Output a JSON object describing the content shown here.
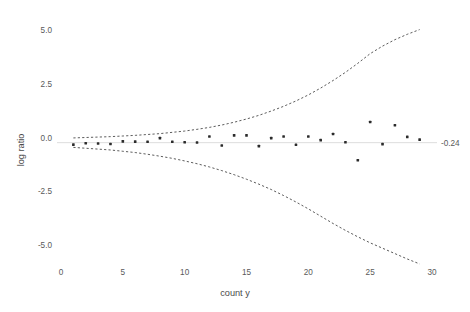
{
  "chart_data": {
    "type": "scatter",
    "title": "",
    "xlabel": "count y",
    "ylabel": "log ratio",
    "xlim": [
      -1.5,
      32.5
    ],
    "ylim": [
      -6.2,
      6.0
    ],
    "grid": false,
    "legend": null,
    "xticks": [
      0,
      5,
      10,
      15,
      20,
      25,
      30
    ],
    "xtick_labels": [
      "0",
      "5",
      "10",
      "15",
      "20",
      "25",
      "30"
    ],
    "yticks": [
      5.0,
      2.5,
      0.0,
      -2.5,
      -5.0
    ],
    "ytick_labels": [
      "5.0",
      "2.5",
      "0.0",
      "-2.5",
      "-5.0"
    ],
    "x": [
      1,
      2,
      3,
      4,
      5,
      6,
      7,
      8,
      9,
      10,
      11,
      12,
      13,
      14,
      15,
      16,
      17,
      18,
      19,
      20,
      21,
      22,
      23,
      24,
      25,
      26,
      27,
      28,
      29
    ],
    "values": [
      -0.33,
      -0.27,
      -0.28,
      -0.3,
      -0.18,
      -0.19,
      -0.2,
      -0.03,
      -0.2,
      -0.22,
      -0.23,
      0.05,
      -0.37,
      0.1,
      0.1,
      -0.4,
      -0.03,
      0.05,
      -0.34,
      0.05,
      -0.12,
      0.16,
      -0.22,
      -1.06,
      0.72,
      -0.31,
      0.57,
      0.03,
      -0.1
    ],
    "reference_line": {
      "y": -0.24,
      "label": "-0.24",
      "style": "solid",
      "color": "#d9d9d9"
    },
    "control_limits": {
      "label": "funnel control limits",
      "style": "dashed",
      "color": "#4a4a4a",
      "upper": {
        "x": [
          1,
          2,
          3,
          4,
          5,
          6,
          7,
          8,
          9,
          10,
          11,
          12,
          13,
          14,
          15,
          16,
          17,
          18,
          19,
          20,
          21,
          22,
          23,
          24,
          25,
          26,
          27,
          28,
          29
        ],
        "y": [
          -0.02,
          0.0,
          0.02,
          0.04,
          0.07,
          0.1,
          0.14,
          0.18,
          0.24,
          0.3,
          0.38,
          0.47,
          0.58,
          0.71,
          0.86,
          1.03,
          1.23,
          1.45,
          1.7,
          1.98,
          2.3,
          2.65,
          3.03,
          3.45,
          3.9,
          4.25,
          4.55,
          4.8,
          5.02
        ]
      },
      "lower": {
        "x": [
          1,
          2,
          3,
          4,
          5,
          6,
          7,
          8,
          9,
          10,
          11,
          12,
          13,
          14,
          15,
          16,
          17,
          18,
          19,
          20,
          21,
          22,
          23,
          24,
          25,
          26,
          27,
          28,
          29
        ],
        "y": [
          -0.46,
          -0.5,
          -0.54,
          -0.58,
          -0.64,
          -0.7,
          -0.78,
          -0.87,
          -0.97,
          -1.09,
          -1.22,
          -1.37,
          -1.54,
          -1.73,
          -1.94,
          -2.17,
          -2.42,
          -2.7,
          -3.0,
          -3.32,
          -3.66,
          -4.0,
          -4.32,
          -4.62,
          -4.9,
          -5.15,
          -5.4,
          -5.65,
          -5.88
        ]
      }
    }
  }
}
